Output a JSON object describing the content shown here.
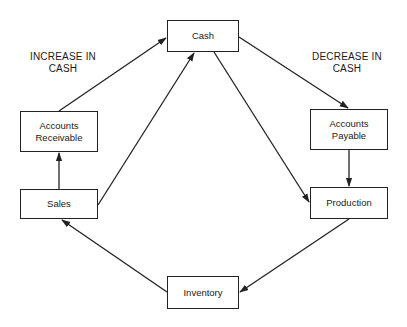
{
  "diagram": {
    "type": "flowchart",
    "nodes": {
      "cash": {
        "label": "Cash",
        "x": 167,
        "y": 20,
        "w": 72,
        "h": 32
      },
      "ar": {
        "label": "Accounts\nReceivable",
        "x": 20,
        "y": 111,
        "w": 78,
        "h": 41
      },
      "ap": {
        "label": "Accounts\nPayable",
        "x": 310,
        "y": 109,
        "w": 78,
        "h": 41
      },
      "sales": {
        "label": "Sales",
        "x": 20,
        "y": 189,
        "w": 78,
        "h": 30
      },
      "production": {
        "label": "Production",
        "x": 310,
        "y": 187,
        "w": 78,
        "h": 32
      },
      "inventory": {
        "label": "Inventory",
        "x": 167,
        "y": 276,
        "w": 72,
        "h": 33
      }
    },
    "annotations": {
      "increase": "INCREASE IN\nCASH",
      "decrease": "DECREASE IN\nCASH"
    },
    "edges": [
      {
        "from": "Accounts Receivable",
        "to": "Cash"
      },
      {
        "from": "Sales",
        "to": "Accounts Receivable"
      },
      {
        "from": "Sales",
        "to": "Cash"
      },
      {
        "from": "Cash",
        "to": "Accounts Payable"
      },
      {
        "from": "Cash",
        "to": "Production"
      },
      {
        "from": "Accounts Payable",
        "to": "Production"
      },
      {
        "from": "Production",
        "to": "Inventory"
      },
      {
        "from": "Inventory",
        "to": "Sales"
      }
    ],
    "colors": {
      "stroke": "#222222",
      "background": "#ffffff"
    }
  }
}
